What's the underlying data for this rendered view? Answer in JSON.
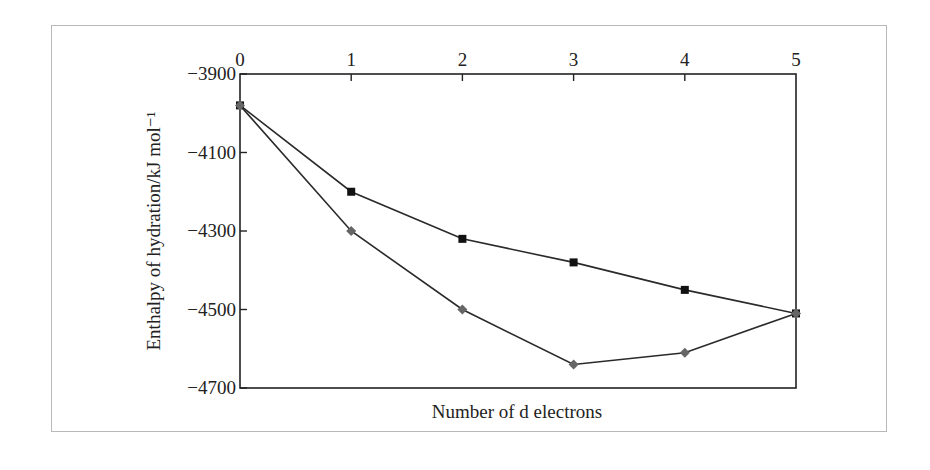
{
  "chart_data": {
    "type": "line",
    "title": "",
    "xlabel": "Number of d electrons",
    "ylabel": "Enthalpy of hydration/kJ mol⁻¹",
    "x": [
      0,
      1,
      2,
      3,
      4,
      5
    ],
    "xlim": [
      0,
      5
    ],
    "ylim": [
      -4700,
      -3900
    ],
    "xticks": [
      "0",
      "1",
      "2",
      "3",
      "4",
      "5"
    ],
    "xaxis_position": "top",
    "yticks": [
      "−3900",
      "−4100",
      "−4300",
      "−4500",
      "−4700"
    ],
    "ytick_values": [
      -3900,
      -4100,
      -4300,
      -4500,
      -4700
    ],
    "grid": false,
    "legend": null,
    "series": [
      {
        "name": "square markers (upper curve)",
        "marker": "square",
        "color": "#111111",
        "values": [
          -3980,
          -4200,
          -4320,
          -4380,
          -4450,
          -4510
        ]
      },
      {
        "name": "diamond markers (lower curve)",
        "marker": "diamond",
        "color": "#666666",
        "values": [
          -3980,
          -4300,
          -4500,
          -4640,
          -4610,
          -4510
        ]
      }
    ]
  }
}
